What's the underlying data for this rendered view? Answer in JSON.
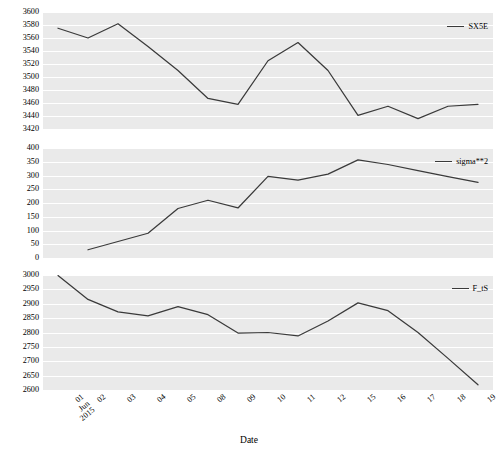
{
  "chart_data": [
    {
      "type": "line",
      "panel": 1,
      "title": "",
      "xlabel": "",
      "ylabel": "",
      "ylim": [
        3420,
        3600
      ],
      "yticks": [
        3420,
        3440,
        3460,
        3480,
        3500,
        3520,
        3540,
        3560,
        3580,
        3600
      ],
      "grid": true,
      "legend_position": "upper right",
      "x": [
        "01\nJun\n2015",
        "02",
        "03",
        "04",
        "05",
        "08",
        "09",
        "10",
        "11",
        "12",
        "15",
        "16",
        "17",
        "18",
        "19"
      ],
      "series": [
        {
          "name": "SX5E",
          "color": "#3a3a3a",
          "values": [
            3575,
            3560,
            3582,
            3547,
            3510,
            3467,
            3458,
            3525,
            3553,
            3510,
            3441,
            3455,
            3436,
            3455,
            3458
          ]
        }
      ]
    },
    {
      "type": "line",
      "panel": 2,
      "title": "",
      "xlabel": "",
      "ylabel": "",
      "ylim": [
        0,
        400
      ],
      "yticks": [
        0,
        50,
        100,
        150,
        200,
        250,
        300,
        350,
        400
      ],
      "grid": true,
      "legend_position": "upper right",
      "x": [
        "01\nJun\n2015",
        "02",
        "03",
        "04",
        "05",
        "08",
        "09",
        "10",
        "11",
        "12",
        "15",
        "16",
        "17",
        "18",
        "19"
      ],
      "series": [
        {
          "name": "sigma**2",
          "color": "#3a3a3a",
          "values": [
            null,
            30,
            60,
            90,
            180,
            210,
            182,
            297,
            283,
            305,
            357,
            340,
            318,
            296,
            275
          ]
        }
      ]
    },
    {
      "type": "line",
      "panel": 3,
      "title": "",
      "xlabel": "Date",
      "ylabel": "",
      "ylim": [
        2600,
        3000
      ],
      "yticks": [
        2600,
        2650,
        2700,
        2750,
        2800,
        2850,
        2900,
        2950,
        3000
      ],
      "grid": true,
      "legend_position": "upper right",
      "x": [
        "01\nJun\n2015",
        "02",
        "03",
        "04",
        "05",
        "08",
        "09",
        "10",
        "11",
        "12",
        "15",
        "16",
        "17",
        "18",
        "19"
      ],
      "series": [
        {
          "name": "F_tS",
          "color": "#3a3a3a",
          "values": [
            2998,
            2915,
            2872,
            2858,
            2890,
            2862,
            2798,
            2800,
            2788,
            2840,
            2903,
            2876,
            2800,
            2710,
            2618
          ]
        }
      ]
    }
  ],
  "axis": {
    "xlabel": "Date",
    "xticklabels": [
      {
        "lines": [
          "01",
          "Jun",
          "2015"
        ]
      },
      {
        "lines": [
          "02"
        ]
      },
      {
        "lines": [
          "03"
        ]
      },
      {
        "lines": [
          "04"
        ]
      },
      {
        "lines": [
          "05"
        ]
      },
      {
        "lines": [
          "08"
        ]
      },
      {
        "lines": [
          "09"
        ]
      },
      {
        "lines": [
          "10"
        ]
      },
      {
        "lines": [
          "11"
        ]
      },
      {
        "lines": [
          "12"
        ]
      },
      {
        "lines": [
          "15"
        ]
      },
      {
        "lines": [
          "16"
        ]
      },
      {
        "lines": [
          "17"
        ]
      },
      {
        "lines": [
          "18"
        ]
      },
      {
        "lines": [
          "19"
        ]
      }
    ]
  },
  "style": {
    "plot_background": "#eaeaea",
    "figure_background": "#ffffff",
    "gridline_color": "#ffffff",
    "line_color": "#3a3a3a"
  }
}
